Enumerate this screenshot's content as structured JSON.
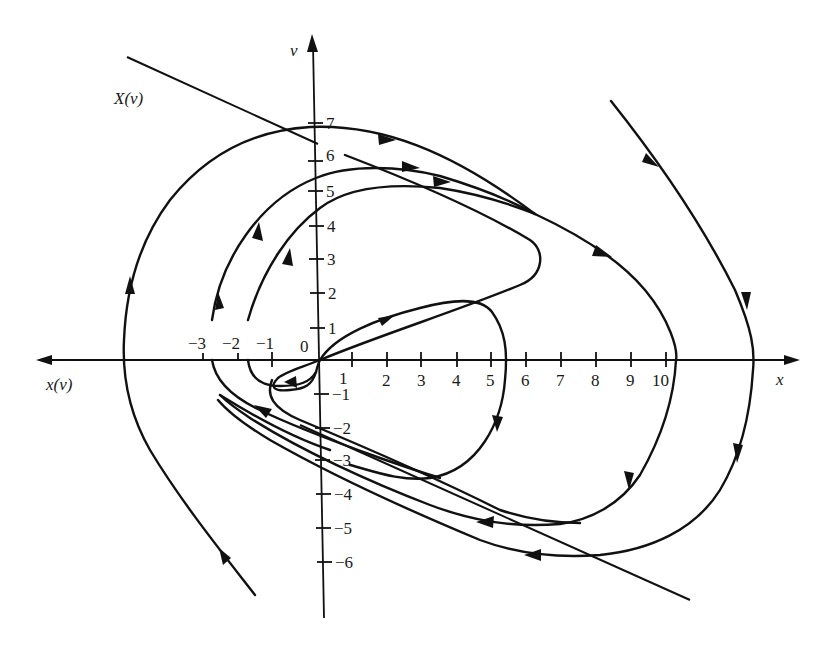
{
  "figure": {
    "x_axis_label": "x",
    "x_axis_left_label": "x(ν)",
    "v_axis_label": "ν",
    "line_label": "X(ν)",
    "origin_label": "0",
    "x_ticks": [
      {
        "label": "−3",
        "value": -3
      },
      {
        "label": "−2",
        "value": -2
      },
      {
        "label": "−1",
        "value": -1
      },
      {
        "label": "1",
        "value": 1
      },
      {
        "label": "2",
        "value": 2
      },
      {
        "label": "3",
        "value": 3
      },
      {
        "label": "4",
        "value": 4
      },
      {
        "label": "5",
        "value": 5
      },
      {
        "label": "6",
        "value": 6
      },
      {
        "label": "7",
        "value": 7
      },
      {
        "label": "8",
        "value": 8
      },
      {
        "label": "9",
        "value": 9
      },
      {
        "label": "10",
        "value": 10
      }
    ],
    "v_ticks": [
      {
        "label": "7",
        "value": 7
      },
      {
        "label": "6",
        "value": 6
      },
      {
        "label": "5",
        "value": 5
      },
      {
        "label": "4",
        "value": 4
      },
      {
        "label": "3",
        "value": 3
      },
      {
        "label": "2",
        "value": 2
      },
      {
        "label": "1",
        "value": 1
      },
      {
        "label": "−1",
        "value": -1
      },
      {
        "label": "−2",
        "value": -2
      },
      {
        "label": "−3",
        "value": -3
      },
      {
        "label": "−4",
        "value": -4
      },
      {
        "label": "−5",
        "value": -5
      },
      {
        "label": "−6",
        "value": -6
      }
    ],
    "trajectories": [
      {
        "name": "inner-loop-from-origin",
        "description": "from origin up-right to (4.2,1.6), down through (5.5,0), bottom near (3.3,-3.5), returning left"
      },
      {
        "name": "tongue-orbit",
        "description": "origin up-right to (6.5,3), turning back up-left toward (0.8,6)"
      },
      {
        "name": "orbit-from-minus-2",
        "description": "from (-2,0) up through (0,4.5) merging toward upper-right band"
      },
      {
        "name": "orbit-from-minus-3",
        "description": "from (-3,0) up through (0,5.4) merging toward upper-right band"
      },
      {
        "name": "large-orbit",
        "description": "upper band down-right crossing x-axis near 10.3, down to (7,-5), left along lower band"
      },
      {
        "name": "outer-left-orbit",
        "description": "from lower-left up through x≈-5.7, over top near (0,6.8) to upper-right band"
      },
      {
        "name": "outer-right-orbit",
        "description": "from upper-right down crossing x-axis near 12.6, to (8,-5.8), left along lower band"
      }
    ],
    "switching_line": {
      "label": "X(ν)",
      "description": "straight line descending from upper-left to lower-right"
    }
  }
}
